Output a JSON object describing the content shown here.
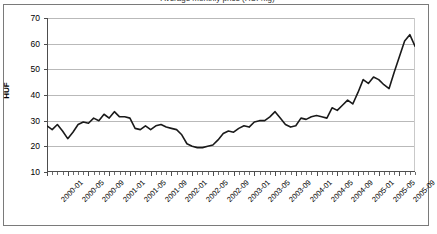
{
  "figure": {
    "title_clipped": "Average monthly price (HUF/kg)",
    "border_color": "#7a7a7a",
    "background": "#ffffff"
  },
  "chart_data": {
    "type": "line",
    "title": "Average monthly price (HUF/kg)",
    "xlabel": "",
    "ylabel": "HUF",
    "ylim": [
      10,
      70
    ],
    "yticks": [
      10,
      20,
      30,
      40,
      50,
      60,
      70
    ],
    "grid": true,
    "legend": "none",
    "line_color": "#1a1a1a",
    "line_width": 1.6,
    "tick_label_rotation": -45,
    "tick_label_interval_months": 4,
    "x_tick_labels": [
      "2000-01",
      "2000-05",
      "2000-09",
      "2001-01",
      "2001-05",
      "2001-09",
      "2002-01",
      "2002-05",
      "2002-09",
      "2003-01",
      "2003-05",
      "2003-09",
      "2004-01",
      "2004-05",
      "2004-09",
      "2005-01",
      "2005-05",
      "2005-09"
    ],
    "x": [
      "2000-01",
      "2000-02",
      "2000-03",
      "2000-04",
      "2000-05",
      "2000-06",
      "2000-07",
      "2000-08",
      "2000-09",
      "2000-10",
      "2000-11",
      "2000-12",
      "2001-01",
      "2001-02",
      "2001-03",
      "2001-04",
      "2001-05",
      "2001-06",
      "2001-07",
      "2001-08",
      "2001-09",
      "2001-10",
      "2001-11",
      "2001-12",
      "2002-01",
      "2002-02",
      "2002-03",
      "2002-04",
      "2002-05",
      "2002-06",
      "2002-07",
      "2002-08",
      "2002-09",
      "2002-10",
      "2002-11",
      "2002-12",
      "2003-01",
      "2003-02",
      "2003-03",
      "2003-04",
      "2003-05",
      "2003-06",
      "2003-07",
      "2003-08",
      "2003-09",
      "2003-10",
      "2003-11",
      "2003-12",
      "2004-01",
      "2004-02",
      "2004-03",
      "2004-04",
      "2004-05",
      "2004-06",
      "2004-07",
      "2004-08",
      "2004-09",
      "2004-10",
      "2004-11",
      "2004-12",
      "2005-01",
      "2005-02",
      "2005-03",
      "2005-04",
      "2005-05",
      "2005-06",
      "2005-07",
      "2005-08",
      "2005-09",
      "2005-10",
      "2005-11",
      "2005-12"
    ],
    "values": [
      28.0,
      26.5,
      28.5,
      26.0,
      23.0,
      25.5,
      28.5,
      29.5,
      29.0,
      31.0,
      30.0,
      32.5,
      31.0,
      33.5,
      31.5,
      31.5,
      31.0,
      27.0,
      26.5,
      28.0,
      26.5,
      28.0,
      28.5,
      27.5,
      27.0,
      26.5,
      24.5,
      21.0,
      20.0,
      19.5,
      19.5,
      20.0,
      20.5,
      22.5,
      25.0,
      26.0,
      25.5,
      27.0,
      28.0,
      27.5,
      29.5,
      30.0,
      30.0,
      31.5,
      33.5,
      31.0,
      28.5,
      27.5,
      28.0,
      31.0,
      30.5,
      31.5,
      32.0,
      31.5,
      31.0,
      35.0,
      34.0,
      36.0,
      38.0,
      36.5,
      41.0,
      46.0,
      44.5,
      47.0,
      46.0,
      44.0,
      42.5,
      49.0,
      55.0,
      61.0,
      63.5,
      59.0
    ]
  }
}
